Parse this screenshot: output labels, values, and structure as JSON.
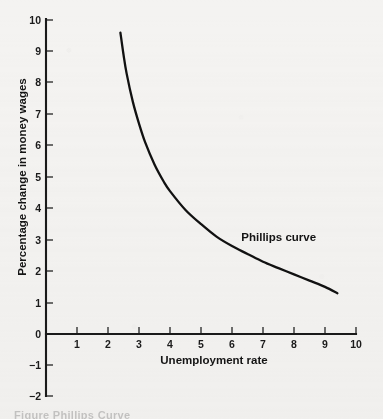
{
  "chart_data": {
    "type": "line",
    "title": "",
    "xlabel": "Unemployment rate",
    "ylabel": "Percentage change in money wages",
    "xlim": [
      0,
      10
    ],
    "ylim": [
      -2,
      10
    ],
    "grid": false,
    "legend_position": "inline-annotation",
    "x_ticks": [
      "1",
      "2",
      "3",
      "4",
      "5",
      "6",
      "7",
      "8",
      "9",
      "10"
    ],
    "x_tick_values": [
      1,
      2,
      3,
      4,
      5,
      6,
      7,
      8,
      9,
      10
    ],
    "y_ticks": [
      "10",
      "9",
      "8",
      "7",
      "6",
      "5",
      "4",
      "3",
      "2",
      "1",
      "0",
      "−1",
      "−2"
    ],
    "y_tick_values": [
      10,
      9,
      8,
      7,
      6,
      5,
      4,
      3,
      2,
      1,
      0,
      -1,
      -2
    ],
    "series": [
      {
        "name": "Phillips curve",
        "color": "#111111",
        "x": [
          2.4,
          2.5,
          2.6,
          2.8,
          3.0,
          3.2,
          3.5,
          3.8,
          4.0,
          4.5,
          5.0,
          5.5,
          6.0,
          6.5,
          7.0,
          7.5,
          8.0,
          8.5,
          9.0,
          9.4
        ],
        "y": [
          9.6,
          8.9,
          8.3,
          7.4,
          6.7,
          6.1,
          5.4,
          4.85,
          4.55,
          3.95,
          3.5,
          3.1,
          2.8,
          2.55,
          2.3,
          2.1,
          1.9,
          1.7,
          1.5,
          1.3
        ]
      }
    ],
    "annotations": [
      {
        "text": "Phillips curve",
        "x": 6.3,
        "y": 2.95
      }
    ]
  },
  "figure": {
    "background_color": "#f4f3f1",
    "axis_color": "#1a1a1a",
    "cut_caption": "Figure     Phillips Curve"
  }
}
